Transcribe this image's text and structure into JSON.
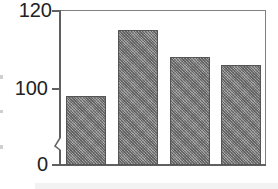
{
  "chart_data": {
    "type": "bar",
    "title": "",
    "xlabel": "",
    "ylabel": "",
    "categories": [
      "Bar 1",
      "Bar 2",
      "Bar 3",
      "Bar 4"
    ],
    "values": [
      98,
      115,
      108,
      106
    ],
    "ylim": [
      0,
      120
    ],
    "y_axis_break": {
      "from": 0,
      "to": 100
    },
    "yticks": [
      "0",
      "100",
      "120"
    ],
    "grid": false,
    "legend": null,
    "bar_color": "#8a8a8a",
    "bar_pattern": "crosshatch"
  },
  "axis": {
    "tick_120": "120",
    "tick_100": "100",
    "tick_0": "0"
  }
}
